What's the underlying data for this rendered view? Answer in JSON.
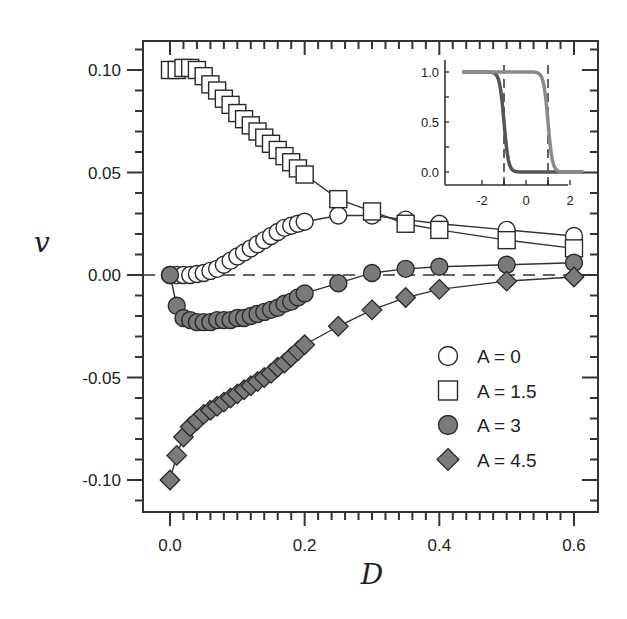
{
  "chart_data": {
    "type": "line",
    "title": "",
    "xlabel": "D",
    "ylabel": "v",
    "xlim": [
      -0.04,
      0.63
    ],
    "ylim": [
      -0.115,
      0.115
    ],
    "xticks": [
      0.0,
      0.2,
      0.4,
      0.6
    ],
    "xtick_labels": [
      "0.0",
      "0.2",
      "0.4",
      "0.6"
    ],
    "yticks": [
      0.1,
      0.05,
      0.0,
      -0.05,
      -0.1
    ],
    "ytick_labels": [
      "0.10",
      "0.05",
      "0.00",
      "-0.05",
      "-0.10"
    ],
    "grid": false,
    "reference_line": {
      "y": 0.0,
      "style": "dashed"
    },
    "legend_position": "lower right",
    "series": [
      {
        "name": "A = 0",
        "marker": "circle-open",
        "x": [
          0.0,
          0.01,
          0.02,
          0.03,
          0.04,
          0.05,
          0.06,
          0.07,
          0.08,
          0.09,
          0.1,
          0.11,
          0.12,
          0.13,
          0.14,
          0.15,
          0.16,
          0.17,
          0.18,
          0.19,
          0.2,
          0.25,
          0.3,
          0.35,
          0.4,
          0.5,
          0.6
        ],
        "values": [
          0.0,
          0.0,
          0.0,
          0.0,
          0.0005,
          0.001,
          0.002,
          0.003,
          0.005,
          0.007,
          0.009,
          0.011,
          0.013,
          0.015,
          0.017,
          0.019,
          0.021,
          0.023,
          0.024,
          0.025,
          0.026,
          0.029,
          0.029,
          0.027,
          0.025,
          0.022,
          0.019
        ]
      },
      {
        "name": "A = 1.5",
        "marker": "square-open",
        "x": [
          0.0,
          0.01,
          0.02,
          0.03,
          0.04,
          0.05,
          0.06,
          0.07,
          0.08,
          0.09,
          0.1,
          0.11,
          0.12,
          0.13,
          0.14,
          0.15,
          0.16,
          0.17,
          0.18,
          0.19,
          0.2,
          0.25,
          0.3,
          0.35,
          0.4,
          0.5,
          0.6
        ],
        "values": [
          0.1,
          0.1,
          0.101,
          0.101,
          0.1,
          0.097,
          0.093,
          0.09,
          0.086,
          0.083,
          0.079,
          0.076,
          0.073,
          0.07,
          0.067,
          0.064,
          0.061,
          0.058,
          0.055,
          0.052,
          0.049,
          0.037,
          0.031,
          0.025,
          0.022,
          0.017,
          0.013
        ]
      },
      {
        "name": "A = 3",
        "marker": "circle-filled",
        "x": [
          0.0,
          0.01,
          0.02,
          0.03,
          0.04,
          0.05,
          0.06,
          0.07,
          0.08,
          0.09,
          0.1,
          0.11,
          0.12,
          0.13,
          0.14,
          0.15,
          0.16,
          0.17,
          0.18,
          0.19,
          0.2,
          0.25,
          0.3,
          0.35,
          0.4,
          0.5,
          0.6
        ],
        "values": [
          0.0,
          -0.015,
          -0.021,
          -0.022,
          -0.023,
          -0.023,
          -0.023,
          -0.022,
          -0.022,
          -0.022,
          -0.021,
          -0.021,
          -0.02,
          -0.019,
          -0.018,
          -0.017,
          -0.016,
          -0.014,
          -0.013,
          -0.011,
          -0.009,
          -0.004,
          0.001,
          0.003,
          0.004,
          0.005,
          0.006
        ]
      },
      {
        "name": "A = 4.5",
        "marker": "diamond-filled",
        "x": [
          0.0,
          0.01,
          0.02,
          0.03,
          0.04,
          0.05,
          0.06,
          0.07,
          0.08,
          0.09,
          0.1,
          0.11,
          0.12,
          0.13,
          0.14,
          0.15,
          0.16,
          0.17,
          0.18,
          0.19,
          0.2,
          0.25,
          0.3,
          0.35,
          0.4,
          0.5,
          0.6
        ],
        "values": [
          -0.1,
          -0.088,
          -0.079,
          -0.074,
          -0.071,
          -0.068,
          -0.066,
          -0.064,
          -0.062,
          -0.06,
          -0.058,
          -0.056,
          -0.054,
          -0.052,
          -0.05,
          -0.048,
          -0.045,
          -0.043,
          -0.04,
          -0.037,
          -0.034,
          -0.025,
          -0.017,
          -0.011,
          -0.007,
          -0.003,
          -0.001
        ]
      }
    ],
    "inset": {
      "type": "line",
      "xlim": [
        -3,
        3
      ],
      "ylim": [
        -0.1,
        1.1
      ],
      "xticks": [
        -2,
        0,
        2
      ],
      "xtick_labels": [
        "-2",
        "0",
        "2"
      ],
      "yticks": [
        0.0,
        0.5,
        1.0
      ],
      "ytick_labels": [
        "0.0",
        "0.5",
        "1.0"
      ],
      "vertical_dashed_lines": [
        -1,
        1
      ],
      "series": [
        {
          "name": "dark curve",
          "description": "step-down sigmoid centered at -1",
          "center": -1,
          "color": "#555555"
        },
        {
          "name": "light curve",
          "description": "step-down sigmoid centered at 1",
          "center": 1,
          "color": "#8a8a8a"
        }
      ]
    }
  },
  "colors": {
    "axis": "#333333",
    "filled_marker": "#7a7a7a",
    "open_marker": "#ffffff",
    "marker_stroke": "#2a2a2a",
    "inset_dark": "#555555",
    "inset_light": "#8a8a8a"
  }
}
